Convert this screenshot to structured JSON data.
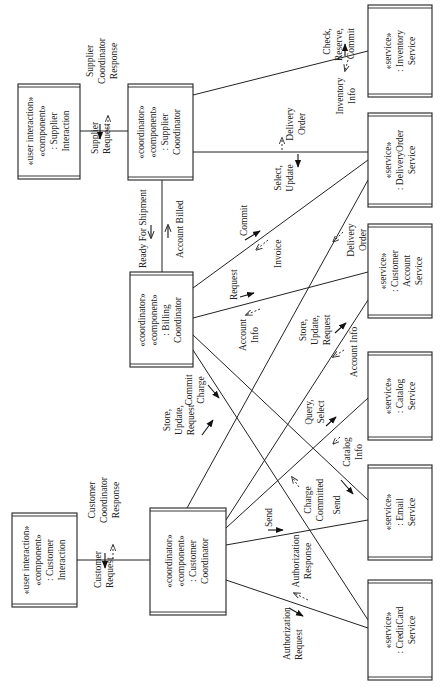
{
  "diagram": {
    "type": "uml-communication-diagram",
    "orientation": "rotated-90-ccw",
    "nodes": [
      {
        "id": "supplier_interaction",
        "stereotypes": [
          "«user interaction»",
          "«component»"
        ],
        "name": ": Supplier",
        "name2": "Interaction",
        "x": 18,
        "y": 84,
        "w": 62,
        "h": 95
      },
      {
        "id": "supplier_coordinator",
        "stereotypes": [
          "«coordinator»",
          "«component»"
        ],
        "name": ": Supplier",
        "name2": "Coordinator",
        "x": 128,
        "y": 84,
        "w": 65,
        "h": 96
      },
      {
        "id": "billing_coordinator",
        "stereotypes": [
          "«coordinator»",
          "«component»"
        ],
        "name": ": Billing",
        "name2": "Coordinator",
        "x": 130,
        "y": 272,
        "w": 63,
        "h": 95
      },
      {
        "id": "customer_interaction",
        "stereotypes": [
          "«user interaction»",
          "«component»"
        ],
        "name": ": Customer",
        "name2": "Interaction",
        "x": 12,
        "y": 513,
        "w": 65,
        "h": 94
      },
      {
        "id": "customer_coordinator",
        "stereotypes": [
          "«coordinator»",
          "«component»"
        ],
        "name": ": Customer",
        "name2": "Coordinator",
        "x": 150,
        "y": 508,
        "w": 76,
        "h": 107
      },
      {
        "id": "inventory_service",
        "stereotypes": [
          "«service»"
        ],
        "name": ": Inventory",
        "name2": "Service",
        "x": 368,
        "y": 5,
        "w": 64,
        "h": 92
      },
      {
        "id": "deliveryorder_service",
        "stereotypes": [
          "«service»"
        ],
        "name": ": DeliveryOrder",
        "name2": "Service",
        "x": 368,
        "y": 113,
        "w": 64,
        "h": 94
      },
      {
        "id": "customeraccount_service",
        "stereotypes": [
          "«service»"
        ],
        "name": ": Customer",
        "name2": "Account",
        "name3": "Service",
        "x": 368,
        "y": 224,
        "w": 64,
        "h": 94
      },
      {
        "id": "catalog_service",
        "stereotypes": [
          "«service»"
        ],
        "name": ": Catalog",
        "name2": "Service",
        "x": 368,
        "y": 352,
        "w": 64,
        "h": 88
      },
      {
        "id": "email_service",
        "stereotypes": [
          "«service»"
        ],
        "name": ": Email",
        "name2": "Service",
        "x": 368,
        "y": 465,
        "w": 64,
        "h": 95
      },
      {
        "id": "creditcard_service",
        "stereotypes": [
          "«service»"
        ],
        "name": ": CreditCard",
        "name2": "Service",
        "x": 368,
        "y": 580,
        "w": 64,
        "h": 100
      }
    ],
    "messages": {
      "supplier_request": "Supplier Request",
      "supplier_coordinator_response": "Supplier Coordinator Response",
      "check_reserve_commit": "Check, Reserve, Commit",
      "inventory_info": "Inventory Info",
      "select_update": "Select, Update",
      "delivery_order_1": "Delivery Order",
      "ready_for_shipment": "Ready For Shipment",
      "account_billed": "Account Billed",
      "commit": "Commit",
      "invoice": "Invoice",
      "request": "Request",
      "account_info_1": "Account Info",
      "delivery_order_2": "Delivery Order",
      "store_update_request_1": "Store, Update, Request",
      "account_info_2": "Account Info",
      "commit_charge": "Commit Charge",
      "store_update_request_2": "Store, Update, Request",
      "query_select": "Query, Select",
      "catalog_info": "Catalog Info",
      "charge_committed": "Charge Committed",
      "send_1": "Send",
      "send_2": "Send",
      "customer_request": "Customer Request",
      "customer_coordinator_response": "Customer Coordinator Response",
      "authorization_request": "Authorization Request",
      "authorization_response": "Authorization Response"
    }
  },
  "labels": {
    "si_s1": "«user interaction»",
    "si_s2": "«component»",
    "si_n1": ": Supplier",
    "si_n2": "Interaction",
    "sc_s1": "«coordinator»",
    "sc_s2": "«component»",
    "sc_n1": ": Supplier",
    "sc_n2": "Coordinator",
    "bc_s1": "«coordinator»",
    "bc_s2": "«component»",
    "bc_n1": ": Billing",
    "bc_n2": "Coordinator",
    "ci_s1": "«user interaction»",
    "ci_s2": "«component»",
    "ci_n1": ": Customer",
    "ci_n2": "Interaction",
    "cc_s1": "«coordinator»",
    "cc_s2": "«component»",
    "cc_n1": ": Customer",
    "cc_n2": "Coordinator",
    "inv_s1": "«service»",
    "inv_n1": ": Inventory",
    "inv_n2": "Service",
    "do_s1": "«service»",
    "do_n1": ": DeliveryOrder",
    "do_n2": "Service",
    "ca_s1": "«service»",
    "ca_n1": ": Customer",
    "ca_n2": "Account",
    "ca_n3": "Service",
    "cat_s1": "«service»",
    "cat_n1": ": Catalog",
    "cat_n2": "Service",
    "em_s1": "«service»",
    "em_n1": ": Email",
    "em_n2": "Service",
    "cr_s1": "«service»",
    "cr_n1": ": CreditCard",
    "cr_n2": "Service",
    "m_supplier_1": "Supplier",
    "m_supplier_2": "Request",
    "m_scr_1": "Supplier",
    "m_scr_2": "Coordinator",
    "m_scr_3": "Response",
    "m_crc_1": "Check,",
    "m_crc_2": "Reserve,",
    "m_crc_3": "Commit",
    "m_inv_1": "Inventory",
    "m_inv_2": "Info",
    "m_su_1": "Select,",
    "m_su_2": "Update",
    "m_do1_1": "Delivery",
    "m_do1_2": "Order",
    "m_rfs": "Ready For Shipment",
    "m_ab": "Account Billed",
    "m_commit": "Commit",
    "m_invoice": "Invoice",
    "m_request": "Request",
    "m_ai1_1": "Account",
    "m_ai1_2": "Info",
    "m_do2_1": "Delivery",
    "m_do2_2": "Order",
    "m_sur1_1": "Store,",
    "m_sur1_2": "Update,",
    "m_sur1_3": "Request",
    "m_ai2": "Account Info",
    "m_cc_1": "Commit",
    "m_cc_2": "Charge",
    "m_sur2_1": "Store,",
    "m_sur2_2": "Update,",
    "m_sur2_3": "Request",
    "m_qs_1": "Query,",
    "m_qs_2": "Select",
    "m_ci_1": "Catalog",
    "m_ci_2": "Info",
    "m_chc_1": "Charge",
    "m_chc_2": "Committed",
    "m_send1": "Send",
    "m_send2": "Send",
    "m_cr_1": "Customer",
    "m_cr_2": "Request",
    "m_ccr_1": "Customer",
    "m_ccr_2": "Coordinator",
    "m_ccr_3": "Response",
    "m_ar_1": "Authorization",
    "m_ar_2": "Request",
    "m_aresp_1": "Authorization",
    "m_aresp_2": "Response"
  }
}
